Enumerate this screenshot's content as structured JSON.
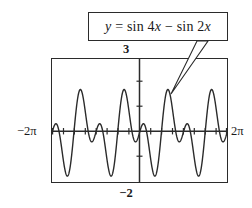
{
  "figure": {
    "name": "graphing-calculator-window-plot",
    "callout": {
      "equation_text": "y = sin 4x − sin 2x",
      "equation_y": "y",
      "equation_rest": " = sin 4",
      "equation_var1": "x",
      "equation_mid": " − sin 2",
      "equation_var2": "x",
      "pointer": "leader-line-to-curve-peak"
    },
    "labels": {
      "y_max": "3",
      "y_min": "−2",
      "x_min": "−2π",
      "x_max": "2π"
    },
    "colors": {
      "ink": "#2b2b2b",
      "curve": "#2b2b2b",
      "background": "#ffffff"
    }
  },
  "chart_data": {
    "type": "line",
    "title": "",
    "annotations": [
      {
        "text": "y = sin 4x − sin 2x",
        "target": "local maximum near x = 0.9"
      }
    ],
    "xlabel": "",
    "ylabel": "",
    "xlim": [
      -6.283185,
      6.283185
    ],
    "ylim": [
      -2,
      3
    ],
    "xlim_labels": [
      "−2π",
      "2π"
    ],
    "ylim_labels": [
      "−2",
      "3"
    ],
    "grid": false,
    "legend": false,
    "xtick_step": 0.785398,
    "ytick_step": 1,
    "series": [
      {
        "name": "y = sin 4x − sin 2x",
        "expression": "sin(4x) - sin(2x)",
        "period": 3.141593,
        "approx_max": 1.76,
        "approx_min": -1.76,
        "color": "#2b2b2b",
        "samples_x": [
          -6.2832,
          -6.0868,
          -5.8905,
          -5.6941,
          -5.4978,
          -5.3014,
          -5.1051,
          -4.9087,
          -4.7124,
          -4.516,
          -4.3197,
          -4.1233,
          -3.927,
          -3.7306,
          -3.5343,
          -3.3379,
          -3.1416,
          -2.9452,
          -2.7489,
          -2.5525,
          -2.3562,
          -2.1598,
          -1.9635,
          -1.7671,
          -1.5708,
          -1.3744,
          -1.1781,
          -0.9817,
          -0.7854,
          -0.589,
          -0.3927,
          -0.1963,
          0.0,
          0.1963,
          0.3927,
          0.589,
          0.7854,
          0.9817,
          1.1781,
          1.3744,
          1.5708,
          1.7671,
          1.9635,
          2.1598,
          2.3562,
          2.5525,
          2.7489,
          2.9452,
          3.1416,
          3.3379,
          3.5343,
          3.7306,
          3.927,
          4.1233,
          4.3197,
          4.516,
          4.7124,
          4.9087,
          5.1051,
          5.3014,
          5.4978,
          5.6941,
          5.8905,
          6.0868,
          6.2832
        ]
      }
    ]
  }
}
